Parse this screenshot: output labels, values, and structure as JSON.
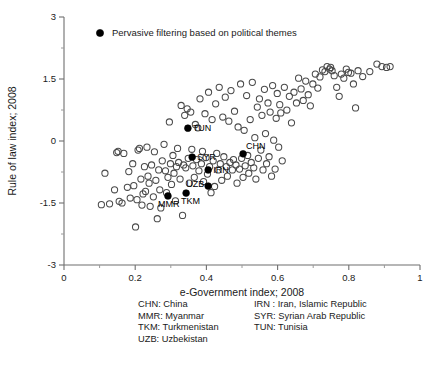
{
  "chart_data": {
    "type": "scatter",
    "title": "",
    "xlabel": "e-Government index; 2008",
    "ylabel": "Rule of law index; 2008",
    "xlim": [
      0,
      1
    ],
    "ylim": [
      -3,
      3
    ],
    "xticks": [
      "0",
      "0.2",
      "0.4",
      "0.6",
      "0.8",
      "1"
    ],
    "xtick_values": [
      0,
      0.2,
      0.4,
      0.6,
      0.8,
      1
    ],
    "yticks": [
      "3",
      "1.5",
      "0",
      "-1.5",
      "-3"
    ],
    "ytick_values": [
      3,
      1.5,
      0,
      -1.5,
      -3
    ],
    "x_minor_step": 0.1,
    "y_minor_step": 0.75,
    "grid": false,
    "legend_position": "top-left-inside",
    "legend": [
      {
        "marker": "filled-circle",
        "label": "Pervasive filtering based on political themes",
        "color": "#000000"
      }
    ],
    "series": [
      {
        "name": "Countries",
        "marker": "open-circle",
        "color": "#4a4a4a",
        "points": [
          [
            0.105,
            -1.54
          ],
          [
            0.115,
            -0.78
          ],
          [
            0.128,
            -1.52
          ],
          [
            0.142,
            -1.18
          ],
          [
            0.148,
            -0.28
          ],
          [
            0.152,
            -0.25
          ],
          [
            0.155,
            -1.46
          ],
          [
            0.163,
            -1.5
          ],
          [
            0.168,
            -0.3
          ],
          [
            0.178,
            -1.12
          ],
          [
            0.182,
            -0.74
          ],
          [
            0.186,
            -1.38
          ],
          [
            0.193,
            -0.55
          ],
          [
            0.196,
            -1.08
          ],
          [
            0.201,
            -2.08
          ],
          [
            0.205,
            -1.42
          ],
          [
            0.208,
            -0.22
          ],
          [
            0.212,
            -0.18
          ],
          [
            0.216,
            -0.92
          ],
          [
            0.219,
            -1.55
          ],
          [
            0.222,
            -1.28
          ],
          [
            0.226,
            -0.62
          ],
          [
            0.229,
            -1.22
          ],
          [
            0.233,
            -0.15
          ],
          [
            0.236,
            -0.85
          ],
          [
            0.239,
            -1.02
          ],
          [
            0.242,
            -1.58
          ],
          [
            0.246,
            -0.58
          ],
          [
            0.251,
            -1.35
          ],
          [
            0.254,
            -0.26
          ],
          [
            0.258,
            -0.95
          ],
          [
            0.262,
            -1.88
          ],
          [
            0.266,
            -0.7
          ],
          [
            0.269,
            -1.18
          ],
          [
            0.272,
            -1.62
          ],
          [
            0.276,
            -0.48
          ],
          [
            0.281,
            -0.08
          ],
          [
            0.285,
            -0.72
          ],
          [
            0.288,
            -1.25
          ],
          [
            0.292,
            -0.88
          ],
          [
            0.296,
            0.46
          ],
          [
            0.299,
            -0.55
          ],
          [
            0.302,
            -1.05
          ],
          [
            0.306,
            -0.35
          ],
          [
            0.309,
            -0.78
          ],
          [
            0.313,
            -1.45
          ],
          [
            0.316,
            -0.62
          ],
          [
            0.319,
            -0.18
          ],
          [
            0.322,
            -0.52
          ],
          [
            0.326,
            -0.92
          ],
          [
            0.329,
            0.86
          ],
          [
            0.333,
            -1.8
          ],
          [
            0.336,
            -0.58
          ],
          [
            0.339,
            0.62
          ],
          [
            0.342,
            -0.65
          ],
          [
            0.346,
            0.78
          ],
          [
            0.349,
            -0.42
          ],
          [
            0.352,
            -1.02
          ],
          [
            0.356,
            0.7
          ],
          [
            0.359,
            -0.2
          ],
          [
            0.362,
            -0.6
          ],
          [
            0.366,
            -0.88
          ],
          [
            0.369,
            0.4
          ],
          [
            0.372,
            -0.45
          ],
          [
            0.376,
            0.32
          ],
          [
            0.379,
            -0.72
          ],
          [
            0.382,
            1.02
          ],
          [
            0.386,
            -0.55
          ],
          [
            0.389,
            -0.25
          ],
          [
            0.392,
            -0.98
          ],
          [
            0.396,
            0.66
          ],
          [
            0.399,
            -0.4
          ],
          [
            0.403,
            -0.8
          ],
          [
            0.406,
            1.18
          ],
          [
            0.409,
            -0.62
          ],
          [
            0.413,
            -1.25
          ],
          [
            0.416,
            0.52
          ],
          [
            0.419,
            -0.48
          ],
          [
            0.423,
            -1.1
          ],
          [
            0.426,
            0.9
          ],
          [
            0.429,
            -0.3
          ],
          [
            0.433,
            -0.7
          ],
          [
            0.436,
            1.3
          ],
          [
            0.439,
            -0.55
          ],
          [
            0.443,
            -0.95
          ],
          [
            0.446,
            0.58
          ],
          [
            0.449,
            -0.38
          ],
          [
            0.453,
            1.06
          ],
          [
            0.456,
            -0.62
          ],
          [
            0.459,
            -0.85
          ],
          [
            0.463,
            0.48
          ],
          [
            0.466,
            -0.52
          ],
          [
            0.469,
            1.22
          ],
          [
            0.473,
            -0.7
          ],
          [
            0.476,
            -0.45
          ],
          [
            0.479,
            0.72
          ],
          [
            0.483,
            -0.58
          ],
          [
            0.486,
            -1.02
          ],
          [
            0.489,
            0.34
          ],
          [
            0.493,
            -0.68
          ],
          [
            0.496,
            1.38
          ],
          [
            0.499,
            -0.42
          ],
          [
            0.503,
            -0.88
          ],
          [
            0.506,
            0.26
          ],
          [
            0.509,
            -0.6
          ],
          [
            0.513,
            1.1
          ],
          [
            0.516,
            -0.35
          ],
          [
            0.519,
            -0.78
          ],
          [
            0.523,
            0.52
          ],
          [
            0.526,
            -0.52
          ],
          [
            0.529,
            1.42
          ],
          [
            0.533,
            -0.65
          ],
          [
            0.536,
            0.08
          ],
          [
            0.539,
            -0.92
          ],
          [
            0.543,
            0.82
          ],
          [
            0.546,
            -0.42
          ],
          [
            0.549,
            1.02
          ],
          [
            0.553,
            -0.22
          ],
          [
            0.556,
            0.62
          ],
          [
            0.559,
            -0.7
          ],
          [
            0.563,
            1.25
          ],
          [
            0.566,
            0.18
          ],
          [
            0.569,
            -0.55
          ],
          [
            0.573,
            0.92
          ],
          [
            0.576,
            -0.38
          ],
          [
            0.579,
            0.7
          ],
          [
            0.583,
            -0.85
          ],
          [
            0.586,
            1.34
          ],
          [
            0.589,
            0.02
          ],
          [
            0.593,
            -0.68
          ],
          [
            0.596,
            0.55
          ],
          [
            0.599,
            1.15
          ],
          [
            0.603,
            -0.15
          ],
          [
            0.606,
            0.88
          ],
          [
            0.609,
            0.68
          ],
          [
            0.613,
            -0.48
          ],
          [
            0.619,
            1.3
          ],
          [
            0.626,
            0.75
          ],
          [
            0.633,
            1.08
          ],
          [
            0.639,
            0.44
          ],
          [
            0.646,
            1.18
          ],
          [
            0.653,
            0.92
          ],
          [
            0.659,
            1.52
          ],
          [
            0.666,
            1.26
          ],
          [
            0.672,
            0.98
          ],
          [
            0.679,
            1.45
          ],
          [
            0.686,
            1.12
          ],
          [
            0.692,
            0.85
          ],
          [
            0.699,
            1.38
          ],
          [
            0.706,
            1.62
          ],
          [
            0.713,
            1.28
          ],
          [
            0.719,
            1.55
          ],
          [
            0.726,
            1.72
          ],
          [
            0.733,
            1.68
          ],
          [
            0.739,
            1.8
          ],
          [
            0.746,
            1.74
          ],
          [
            0.749,
            1.78
          ],
          [
            0.753,
            1.7
          ],
          [
            0.759,
            1.58
          ],
          [
            0.766,
            1.3
          ],
          [
            0.773,
            1.08
          ],
          [
            0.779,
            1.62
          ],
          [
            0.786,
            1.52
          ],
          [
            0.793,
            1.74
          ],
          [
            0.799,
            1.66
          ],
          [
            0.806,
            1.64
          ],
          [
            0.813,
            1.38
          ],
          [
            0.819,
            0.8
          ],
          [
            0.826,
            1.7
          ],
          [
            0.839,
            1.56
          ],
          [
            0.859,
            1.68
          ],
          [
            0.879,
            1.86
          ],
          [
            0.893,
            1.8
          ],
          [
            0.906,
            1.78
          ],
          [
            0.916,
            1.8
          ]
        ]
      },
      {
        "name": "Pervasive filtering based on political themes",
        "marker": "filled-circle",
        "color": "#000000",
        "points": [
          {
            "code": "TUN",
            "x": 0.348,
            "y": 0.31,
            "label_dx": 5,
            "label_dy": 2.5
          },
          {
            "code": "CHN",
            "x": 0.503,
            "y": -0.31,
            "label_dx": 3,
            "label_dy": -4.5
          },
          {
            "code": "SYR",
            "x": 0.36,
            "y": -0.39,
            "label_dx": 5,
            "label_dy": 2.5
          },
          {
            "code": "IRN",
            "x": 0.405,
            "y": -0.7,
            "label_dx": 5,
            "label_dy": 3.5
          },
          {
            "code": "UZB",
            "x": 0.405,
            "y": -1.09,
            "label_dx": -22,
            "label_dy": 0.5
          },
          {
            "code": "TKM",
            "x": 0.343,
            "y": -1.26,
            "label_dx": -5,
            "label_dy": 11
          },
          {
            "code": "MMR",
            "x": 0.292,
            "y": -1.33,
            "label_dx": -10,
            "label_dy": 11
          }
        ]
      }
    ]
  },
  "country_key": {
    "rows": [
      {
        "left": "CHN: China",
        "right": "IRN : Iran, Islamic Republic"
      },
      {
        "left": "MMR: Myanmar",
        "right": "SYR: Syrian Arab Republic"
      },
      {
        "left": "TKM: Turkmenistan",
        "right": "TUN: Tunisia"
      },
      {
        "left": "UZB: Uzbekistan",
        "right": ""
      }
    ]
  }
}
